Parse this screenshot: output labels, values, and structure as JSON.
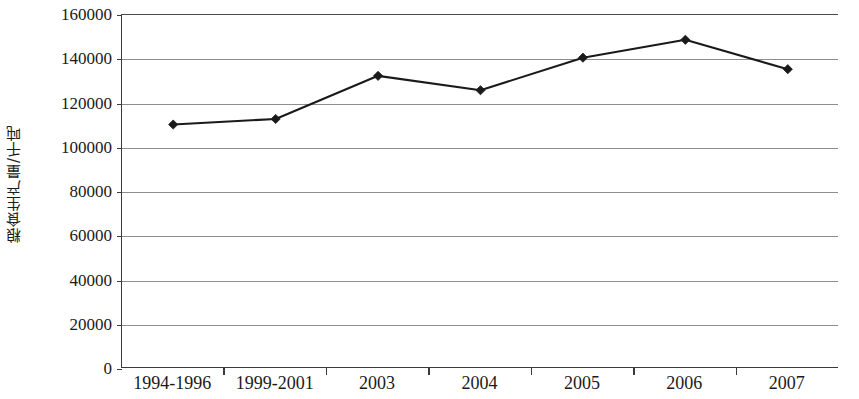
{
  "chart_data": {
    "type": "line",
    "title": "",
    "xlabel": "",
    "ylabel": "粮食生产量/千吨",
    "categories": [
      "1994-1996",
      "1999-2001",
      "2003",
      "2004",
      "2005",
      "2006",
      "2007"
    ],
    "values": [
      110500,
      113000,
      132500,
      126000,
      140700,
      148800,
      135500
    ],
    "series": [
      {
        "name": "粮食生产量",
        "values": [
          110500,
          113000,
          132500,
          126000,
          140700,
          148800,
          135500
        ]
      }
    ],
    "ylim": [
      0,
      160000
    ],
    "y_ticks": [
      0,
      20000,
      40000,
      60000,
      80000,
      100000,
      120000,
      140000,
      160000
    ],
    "y_tick_labels": [
      "0",
      "20000",
      "40000",
      "60000",
      "80000",
      "100000",
      "120000",
      "140000",
      "160000"
    ],
    "grid": true,
    "legend": "none",
    "line_color": "#1a1a1a",
    "marker_color": "#1a1a1a",
    "marker": "diamond",
    "gridline_color": "#8e8e8e",
    "axis_color": "#3a3a3a",
    "background_color": "#ffffff"
  }
}
